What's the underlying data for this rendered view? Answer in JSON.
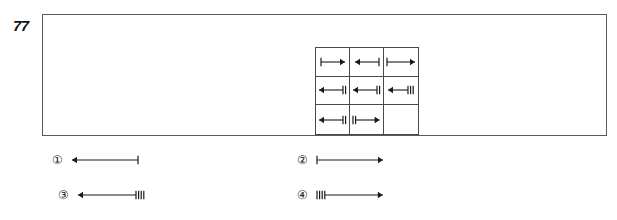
{
  "question": {
    "number": "77",
    "type": "visual-analogy-matrix"
  },
  "colors": {
    "ink": "#1a1a1a",
    "frame_border": "#5a5a5a",
    "matrix_border": "#4a4a4a",
    "background": "#ffffff"
  },
  "matrix": {
    "rows": 3,
    "cols": 3,
    "cells": [
      {
        "id": "cell-r1c1",
        "icon_name": "arrow-right-1-tick-left-icon",
        "direction": "right",
        "ticks": 1,
        "tick_side": "left",
        "length": 24,
        "empty": false
      },
      {
        "id": "cell-r1c2",
        "icon_name": "arrow-left-1-tick-right-icon",
        "direction": "left",
        "ticks": 1,
        "tick_side": "right",
        "length": 24,
        "empty": false
      },
      {
        "id": "cell-r1c3",
        "icon_name": "arrow-right-1-tick-left-long-icon",
        "direction": "right",
        "ticks": 1,
        "tick_side": "left",
        "length": 28,
        "empty": false
      },
      {
        "id": "cell-r2c1",
        "icon_name": "arrow-left-2-ticks-right-icon",
        "direction": "left",
        "ticks": 2,
        "tick_side": "right",
        "length": 24,
        "empty": false
      },
      {
        "id": "cell-r2c2",
        "icon_name": "arrow-left-2-ticks-right-icon",
        "direction": "left",
        "ticks": 2,
        "tick_side": "right",
        "length": 24,
        "empty": false
      },
      {
        "id": "cell-r2c3",
        "icon_name": "arrow-left-3-ticks-right-icon",
        "direction": "left",
        "ticks": 3,
        "tick_side": "right",
        "length": 20,
        "empty": false
      },
      {
        "id": "cell-r3c1",
        "icon_name": "arrow-left-2-ticks-right-icon",
        "direction": "left",
        "ticks": 2,
        "tick_side": "right",
        "length": 24,
        "empty": false
      },
      {
        "id": "cell-r3c2",
        "icon_name": "arrow-right-2-ticks-left-icon",
        "direction": "right",
        "ticks": 2,
        "tick_side": "left",
        "length": 24,
        "empty": false
      },
      {
        "id": "cell-r3c3",
        "icon_name": "empty-cell",
        "direction": "none",
        "ticks": 0,
        "tick_side": "none",
        "length": 0,
        "empty": true
      }
    ]
  },
  "options": [
    {
      "id": "option-1",
      "label": "①",
      "icon_name": "arrow-left-1-tick-right-icon",
      "direction": "left",
      "ticks": 1,
      "tick_side": "right",
      "length": 66
    },
    {
      "id": "option-2",
      "label": "②",
      "icon_name": "arrow-right-1-tick-left-icon",
      "direction": "right",
      "ticks": 1,
      "tick_side": "left",
      "length": 66
    },
    {
      "id": "option-3",
      "label": "③",
      "icon_name": "arrow-left-4-ticks-right-icon",
      "direction": "left",
      "ticks": 4,
      "tick_side": "right",
      "length": 58
    },
    {
      "id": "option-4",
      "label": "④",
      "icon_name": "arrow-right-4-ticks-left-icon",
      "direction": "right",
      "ticks": 4,
      "tick_side": "left",
      "length": 58
    }
  ]
}
